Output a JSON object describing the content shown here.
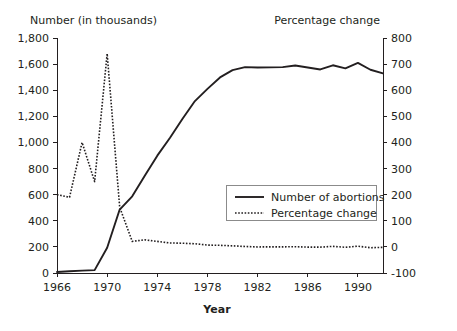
{
  "chart_data": {
    "type": "line",
    "title": "",
    "xlabel": "Year",
    "ylabel": "Number (in thousands)",
    "y2label": "Percentage change",
    "grid": false,
    "legend_position": "center-right",
    "xlim": [
      1966,
      1992
    ],
    "ylim": [
      0,
      1800
    ],
    "y2lim": [
      -100,
      800
    ],
    "x_ticks": [
      1966,
      1970,
      1974,
      1978,
      1982,
      1986,
      1990
    ],
    "x_tick_labels": [
      "1966",
      "1970",
      "1974",
      "1978",
      "1982",
      "1986",
      "1990"
    ],
    "y_ticks": [
      0,
      200,
      400,
      600,
      800,
      1000,
      1200,
      1400,
      1600,
      1800
    ],
    "y_tick_labels": [
      "0",
      "200",
      "400",
      "600",
      "800",
      "1,000",
      "1,200",
      "1,400",
      "1,600",
      "1,800"
    ],
    "y2_ticks": [
      -100,
      0,
      100,
      200,
      300,
      400,
      500,
      600,
      700,
      800
    ],
    "y2_tick_labels": [
      "-100",
      "0",
      "100",
      "200",
      "300",
      "400",
      "500",
      "600",
      "700",
      "800"
    ],
    "x": [
      1966,
      1967,
      1968,
      1969,
      1970,
      1971,
      1972,
      1973,
      1974,
      1975,
      1976,
      1977,
      1978,
      1979,
      1980,
      1981,
      1982,
      1983,
      1984,
      1985,
      1986,
      1987,
      1988,
      1989,
      1990,
      1991,
      1992
    ],
    "series": [
      {
        "name": "Number of abortions",
        "axis": "left",
        "style": "solid",
        "values": [
          8,
          13,
          18,
          22,
          193,
          486,
          587,
          745,
          899,
          1034,
          1179,
          1317,
          1410,
          1498,
          1554,
          1577,
          1574,
          1575,
          1577,
          1589,
          1574,
          1559,
          1591,
          1567,
          1609,
          1557,
          1529
        ]
      },
      {
        "name": "Percentage change",
        "axis": "right",
        "style": "dotted",
        "values": [
          200,
          190,
          400,
          250,
          740,
          152,
          21,
          27,
          21,
          15,
          14,
          12,
          7,
          6,
          4,
          1.5,
          -0.2,
          0.1,
          0.1,
          0.8,
          -0.9,
          -1.0,
          2.1,
          -1.5,
          2.7,
          -3.2,
          -1.8
        ]
      }
    ]
  },
  "legend": {
    "entries": [
      {
        "label": "Number of abortions",
        "style": "solid"
      },
      {
        "label": "Percentage change",
        "style": "dotted"
      }
    ]
  }
}
